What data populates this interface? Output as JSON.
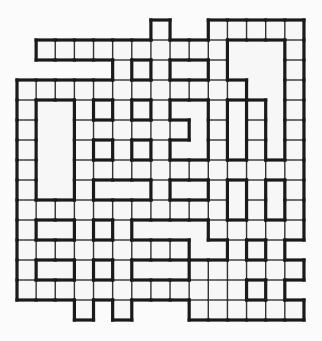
{
  "puzzle": {
    "title": "",
    "rows": 15,
    "cols": 15,
    "origin_x": 17,
    "origin_y": 20,
    "cell_width": 19.13,
    "cell_height": 20,
    "legend": {
      ".": "empty (outside grid)",
      "o": "regular cell",
      "#": "single thick-bordered cell",
      "A-M": "merged region (block)"
    },
    "grid": [
      ".......o..ooooo",
      ".ooooooooooAAAo",
      ".....o#oBBoAAAo",
      "ooooooooooooAAo",
      "oCCo#o#oDDoEoAo",
      "oCCooooooDoEoAo",
      "oCCo#o#oDDoEoAo",
      "oCCoooooooooooo",
      "oCCoFFFoGGoHoIo",
      "oooooooooooHoIo",
      "oJJo#oKKKKooooo",
      "oooooooooKKo#o.",
      "oLLo#oMMMoooooo",
      "oooooooooooo#o.",
      "...o.o...oooooo"
    ],
    "colors": {
      "background": "#fbfbfb",
      "cell_fill": "#f7f7f7",
      "thin_line": "#333333",
      "thick_line": "#1a1a1a"
    },
    "line_widths": {
      "thin": 1.4,
      "thick": 3.2
    }
  }
}
